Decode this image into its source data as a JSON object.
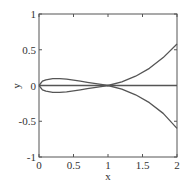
{
  "chart_data": {
    "type": "line",
    "title": "",
    "xlabel": "x",
    "ylabel": "y",
    "xlim": [
      0,
      2
    ],
    "ylim": [
      -1,
      1
    ],
    "xticks": [
      0,
      0.5,
      1,
      1.5,
      2
    ],
    "xtick_labels": [
      "0",
      "0.5",
      "1",
      "1.5",
      "2"
    ],
    "yticks": [
      -1,
      -0.5,
      0,
      0.5,
      1
    ],
    "ytick_labels": [
      "-1",
      "-0.5",
      "0",
      "0.5",
      "1"
    ],
    "grid": false,
    "legend": null,
    "series": [
      {
        "name": "upper branch",
        "x": [
          0,
          0.05,
          0.1,
          0.2,
          0.3,
          0.4,
          0.5,
          0.6,
          0.7,
          0.8,
          0.9,
          1.0,
          1.2,
          1.4,
          1.6,
          1.8,
          2.0
        ],
        "y": [
          0,
          0.06,
          0.08,
          0.095,
          0.095,
          0.09,
          0.075,
          0.06,
          0.045,
          0.03,
          0.015,
          0,
          0.05,
          0.13,
          0.24,
          0.39,
          0.58
        ]
      },
      {
        "name": "lower branch",
        "x": [
          0,
          0.05,
          0.1,
          0.2,
          0.3,
          0.4,
          0.5,
          0.6,
          0.7,
          0.8,
          0.9,
          1.0,
          1.2,
          1.4,
          1.6,
          1.8,
          2.0
        ],
        "y": [
          0,
          -0.06,
          -0.08,
          -0.095,
          -0.095,
          -0.09,
          -0.075,
          -0.06,
          -0.045,
          -0.03,
          -0.015,
          0,
          -0.05,
          -0.13,
          -0.24,
          -0.39,
          -0.6
        ]
      },
      {
        "name": "y = 0",
        "x": [
          0,
          2
        ],
        "y": [
          0,
          0
        ]
      }
    ]
  }
}
